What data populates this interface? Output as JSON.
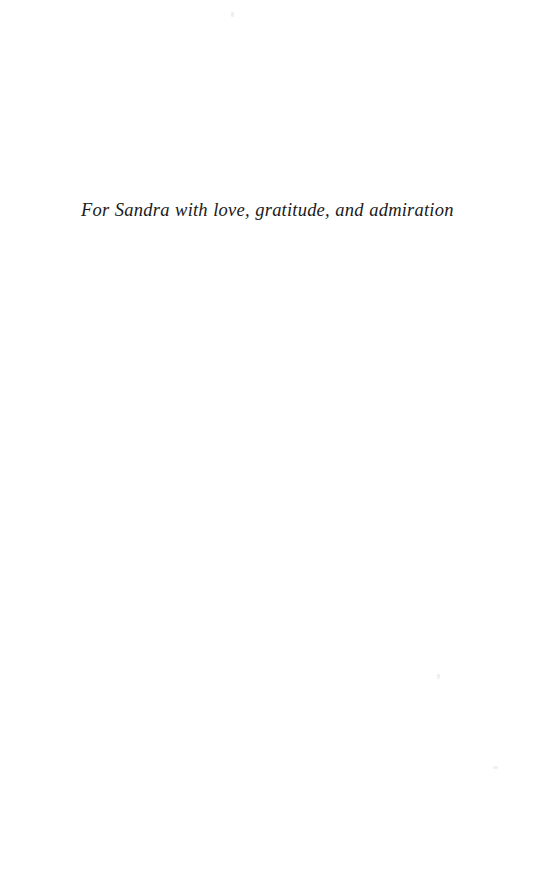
{
  "page": {
    "kind": "book-dedication-page",
    "background_color": "#ffffff",
    "text_color": "#1a1a1a",
    "width": 555,
    "height": 884
  },
  "dedication": {
    "text": "For Sandra with love, gratitude, and admiration",
    "style": "italic-serif",
    "alignment": "left"
  },
  "artifacts": {
    "speck_top": "",
    "speck_right_upper": "",
    "speck_right_lower": ""
  }
}
